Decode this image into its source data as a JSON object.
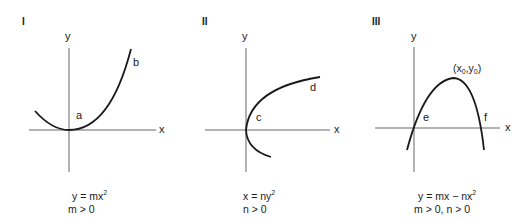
{
  "graphs": [
    {
      "numeral": "I",
      "y_axis_label": "y",
      "x_axis_label": "x",
      "point_labels": [
        "a",
        "b"
      ],
      "equation": {
        "lhs": "y = mx",
        "exp": "2"
      },
      "condition": "m > 0"
    },
    {
      "numeral": "II",
      "y_axis_label": "y",
      "x_axis_label": "x",
      "point_labels": [
        "c",
        "d"
      ],
      "equation": {
        "lhs": "x = ny",
        "exp": "2"
      },
      "condition": "n > 0"
    },
    {
      "numeral": "III",
      "y_axis_label": "y",
      "x_axis_label": "x",
      "point_labels": [
        "e",
        "f"
      ],
      "vertex_label": {
        "open": "(x",
        "sub1": "0",
        "mid": ",y",
        "sub2": "0",
        "close": ")"
      },
      "equation": {
        "lhs": "y = mx − nx",
        "exp": "2"
      },
      "condition": "m > 0, n > 0"
    }
  ],
  "colors": {
    "axis": "#555555",
    "curve": "#1a1a1a",
    "text": "#1a1a1a"
  }
}
